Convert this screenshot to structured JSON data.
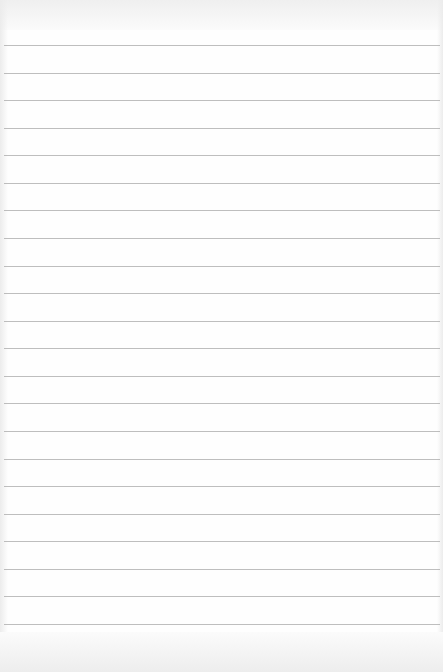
{
  "page": {
    "type": "blank lined paper",
    "background_color": "#fefefe",
    "rule_color": "#a8a8a8",
    "rule_count": 22,
    "first_rule_y": 45,
    "rule_spacing": 27.57
  }
}
